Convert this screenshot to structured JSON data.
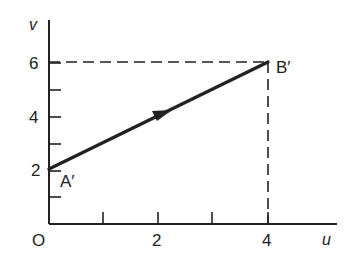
{
  "diagram": {
    "type": "mapping-plane",
    "axes": {
      "x_label": "u",
      "y_label": "v",
      "origin_label": "O",
      "x_ticks": [
        1,
        2,
        3,
        4,
        5
      ],
      "x_tick_labels": [
        "2",
        "4"
      ],
      "y_ticks": [
        1,
        2,
        3,
        4,
        5,
        6
      ],
      "y_tick_labels": [
        "2",
        "4",
        "6"
      ]
    },
    "points": [
      {
        "label": "A′",
        "u": 0,
        "v": 2
      },
      {
        "label": "B′",
        "u": 4,
        "v": 6
      }
    ],
    "segment": {
      "from": "A′",
      "to": "B′",
      "arrow": "midpoint, direction A′→B′"
    },
    "guides": [
      {
        "style": "dashed",
        "from": [
          0,
          6
        ],
        "to": [
          4,
          6
        ]
      },
      {
        "style": "dashed",
        "from": [
          4,
          6
        ],
        "to": [
          4,
          0
        ]
      }
    ],
    "colors": {
      "ink": "#222222",
      "background": "#ffffff"
    }
  }
}
